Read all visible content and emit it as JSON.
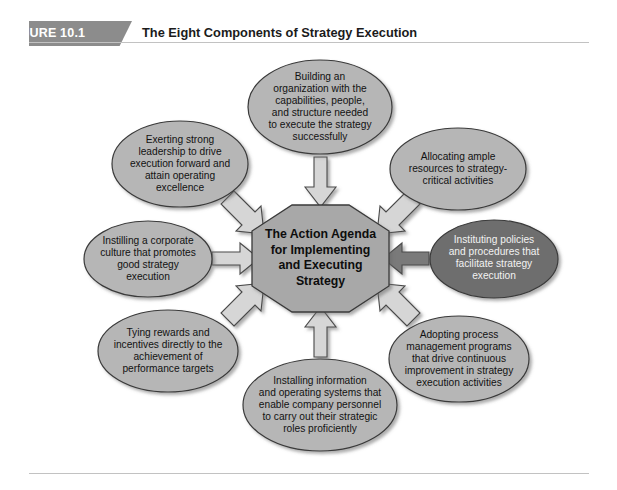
{
  "figure": {
    "badge_label": "FIGURE 10.1",
    "title": "The Eight Components of Strategy Execution"
  },
  "colors": {
    "badge_fill": "#8c8c8c",
    "ellipse_light_fill": "#b6b6b6",
    "ellipse_dark_fill": "#6e6e6e",
    "octagon_fill": "#a8a8a8",
    "arrow_light_fill": "#d6d6d6",
    "arrow_dark_fill": "#7a7a7a",
    "outline": "#3a3a3a",
    "rule": "#c2c2c2",
    "page_background": "#ffffff"
  },
  "center": {
    "label": "The Action Agenda\nfor Implementing\nand Executing\nStrategy",
    "shape": "octagon"
  },
  "components": [
    {
      "id": "building-organization",
      "position": "top",
      "label": "Building an\norganization with the\ncapabilities, people,\nand structure needed\nto execute the strategy\nsuccessfully",
      "emphasis": "normal"
    },
    {
      "id": "exerting-leadership",
      "position": "top-left",
      "label": "Exerting strong\nleadership to drive\nexecution forward and\nattain operating\nexcellence",
      "emphasis": "normal"
    },
    {
      "id": "allocating-resources",
      "position": "top-right",
      "label": "Allocating ample\nresources to strategy-\ncritical activities",
      "emphasis": "normal"
    },
    {
      "id": "instilling-culture",
      "position": "left",
      "label": "Instilling a corporate\nculture that promotes\ngood strategy\nexecution",
      "emphasis": "normal"
    },
    {
      "id": "instituting-policies",
      "position": "right",
      "label": "Instituting policies\nand procedures that\nfacilitate strategy\nexecution",
      "emphasis": "highlighted"
    },
    {
      "id": "tying-rewards",
      "position": "bottom-left",
      "label": "Tying rewards and\nincentives directly to the\nachievement of\nperformance targets",
      "emphasis": "normal"
    },
    {
      "id": "adopting-process-management",
      "position": "bottom-right",
      "label": "Adopting process\nmanagement programs\nthat drive continuous\nimprovement in strategy\nexecution activities",
      "emphasis": "normal"
    },
    {
      "id": "installing-systems",
      "position": "bottom",
      "label": "Installing information\nand operating systems that\nenable company personnel\nto carry out their strategic\nroles proficiently",
      "emphasis": "normal"
    }
  ],
  "arrows": [
    {
      "id": "arrow-top",
      "direction": "down",
      "emphasis": "normal"
    },
    {
      "id": "arrow-top-left",
      "direction": "down-right",
      "emphasis": "normal"
    },
    {
      "id": "arrow-top-right",
      "direction": "down-left",
      "emphasis": "normal"
    },
    {
      "id": "arrow-left",
      "direction": "right",
      "emphasis": "normal"
    },
    {
      "id": "arrow-right",
      "direction": "left",
      "emphasis": "highlighted"
    },
    {
      "id": "arrow-bottom-left",
      "direction": "up-right",
      "emphasis": "normal"
    },
    {
      "id": "arrow-bottom-right",
      "direction": "up-left",
      "emphasis": "normal"
    },
    {
      "id": "arrow-bottom",
      "direction": "up",
      "emphasis": "normal"
    }
  ]
}
